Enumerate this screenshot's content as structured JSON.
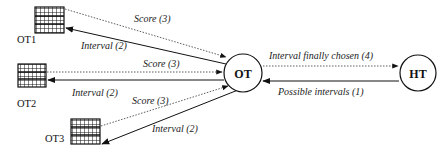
{
  "nodes": {
    "ot": {
      "label": "OT"
    },
    "ht": {
      "label": "HT"
    },
    "ot1": {
      "label": "OT1"
    },
    "ot2": {
      "label": "OT2"
    },
    "ot3": {
      "label": "OT3"
    }
  },
  "edges": {
    "ot1_score": {
      "label": "Score (3)"
    },
    "ot1_interval": {
      "label": "Interval (2)"
    },
    "ot2_score": {
      "label": "Score (3)"
    },
    "ot2_interval": {
      "label": "Interval (2)"
    },
    "ot3_score": {
      "label": "Score (3)"
    },
    "ot3_interval": {
      "label": "Interval (2)"
    },
    "final": {
      "label": "Interval finally chosen (4)"
    },
    "possible": {
      "label": "Possible intervals  (1)"
    }
  }
}
